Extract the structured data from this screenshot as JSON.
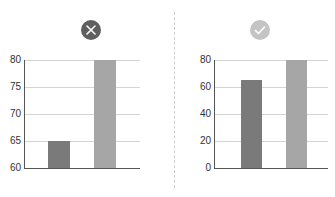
{
  "colors": {
    "bar_dark": "#7a7a7a",
    "bar_light": "#a6a6a6",
    "icon_bad": "#5f5f5f",
    "icon_good": "#c4c4c4",
    "grid": "#d4d4d4",
    "axis": "#555555"
  },
  "panels": [
    {
      "icon": "x-circle-icon",
      "verdict": "bad"
    },
    {
      "icon": "check-circle-icon",
      "verdict": "good"
    }
  ],
  "chart_data": [
    {
      "type": "bar",
      "title": "",
      "categories": [
        "A",
        "B"
      ],
      "values": [
        65,
        80
      ],
      "ylim": [
        60,
        80
      ],
      "yticks": [
        60,
        65,
        70,
        75,
        80
      ],
      "ytick_labels": [
        "60",
        "65",
        "70",
        "75",
        "80"
      ],
      "xlabel": "",
      "ylabel": "",
      "grid": true,
      "annotation": "incorrect (truncated y-axis)"
    },
    {
      "type": "bar",
      "title": "",
      "categories": [
        "A",
        "B"
      ],
      "values": [
        65,
        80
      ],
      "ylim": [
        0,
        80
      ],
      "yticks": [
        0,
        20,
        40,
        60,
        80
      ],
      "ytick_labels": [
        "0",
        "20",
        "40",
        "60",
        "80"
      ],
      "xlabel": "",
      "ylabel": "",
      "grid": true,
      "annotation": "correct (zero-based y-axis)"
    }
  ]
}
